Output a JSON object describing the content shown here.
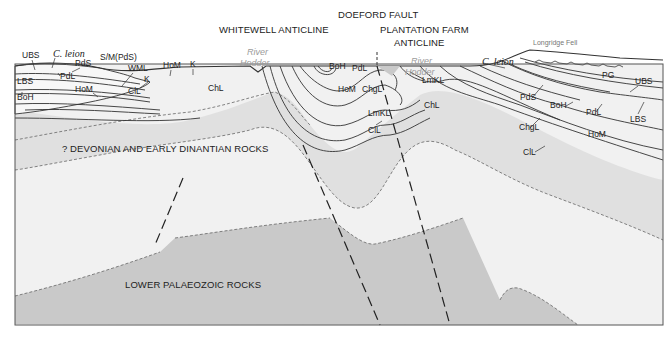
{
  "figure": {
    "type": "geological-cross-section",
    "header_strip": "cut-off page header (illegible)"
  },
  "structures": {
    "whitewell_anticline": "WHITEWELL ANTICLINE",
    "doeford_fault": "DOEFORD FAULT",
    "plantation_farm_line1": "PLANTATION FARM",
    "plantation_farm_line2": "ANTICLINE"
  },
  "rock_units": {
    "devonian": "? DEVONIAN AND EARLY DINANTIAN ROCKS",
    "lower_palaeozoic": "LOWER PALAEOZOIC ROCKS"
  },
  "places": {
    "river_word": "River",
    "hodder_word": "Hodder",
    "longridge_fell": "Longridge Fell"
  },
  "fossil_marker": "C. leion",
  "labels": {
    "ubs": "UBS",
    "pds": "PdS",
    "sm_pds": "S/M(PdS)",
    "pdl": "PdL",
    "lbs": "LBS",
    "boh": "BoH",
    "hom": "HoM",
    "wml": "WML",
    "k": "K",
    "cil": "ClL",
    "chl": "ChL",
    "chgl": "ChgL",
    "lmkl": "LmKL",
    "pg": "PG"
  },
  "colors": {
    "lower_palaeozoic_fill": "#c9c9c9",
    "devonian_fill": "#f1f1f1",
    "limestone_band_fill": "#e0e0e0",
    "upper_beds_fill": "#f7f7f7",
    "line": "#333333",
    "frame": "#555555"
  }
}
